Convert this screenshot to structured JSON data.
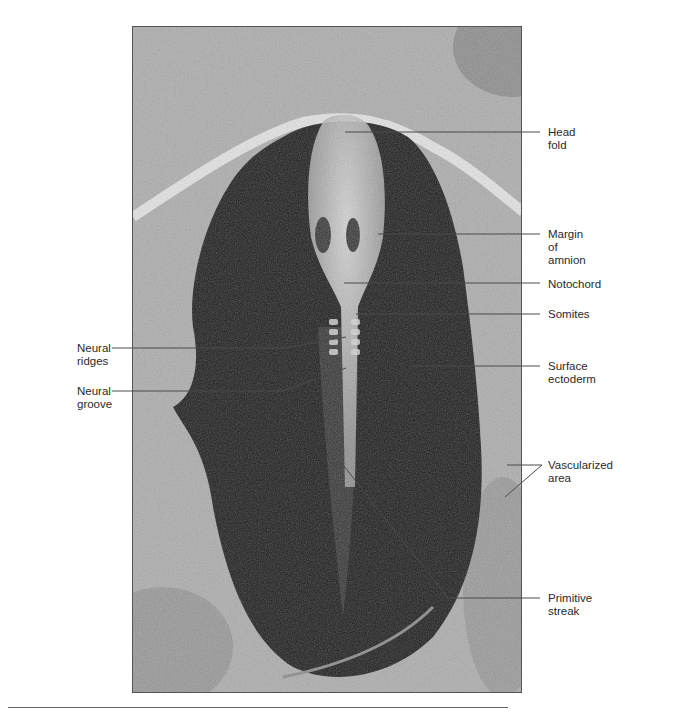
{
  "figure": {
    "labels": {
      "head_fold": "Head fold",
      "head_fold_l1": "Head",
      "head_fold_l2": "fold",
      "margin_l1": "Margin",
      "margin_l2": "of",
      "margin_l3": "amnion",
      "notochord": "Notochord",
      "somites": "Somites",
      "surface_l1": "Surface",
      "surface_l2": "ectoderm",
      "vascular_l1": "Vascularized",
      "vascular_l2": "area",
      "primitive_l1": "Primitive",
      "primitive_l2": "streak",
      "ridges_l1": "Neural",
      "ridges_l2": "ridges",
      "groove_l1": "Neural",
      "groove_l2": "groove"
    },
    "colors": {
      "background": "#ffffff",
      "leader_line": "#4a4a4a",
      "label_text": "#2a2a2a",
      "embryo_dark": "#1e1e1e",
      "yolk_gray": "#a9a9a9"
    }
  }
}
